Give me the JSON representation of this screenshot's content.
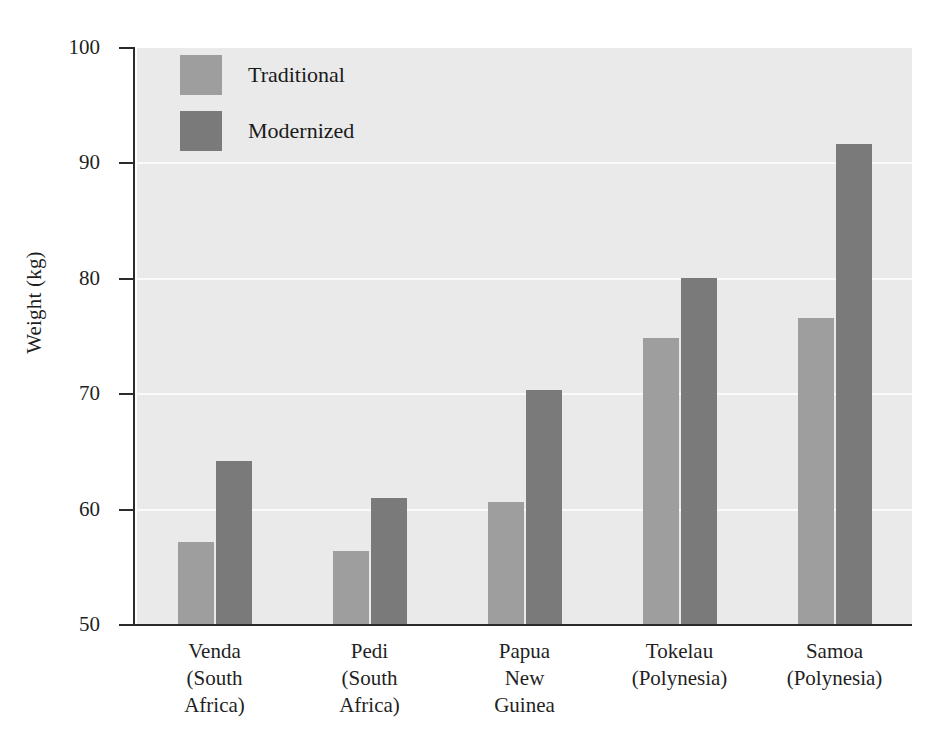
{
  "chart_data": {
    "type": "bar",
    "title": "",
    "xlabel": "",
    "ylabel": "Weight (kg)",
    "ylim": [
      50,
      100
    ],
    "yticks": [
      50,
      60,
      70,
      80,
      90,
      100
    ],
    "ytick_labels": [
      "50",
      "60",
      "70",
      "80",
      "90",
      "100"
    ],
    "grid": true,
    "grid_axis": "y",
    "legend_position": "upper left",
    "categories": [
      "Venda\n(South\nAfrica)",
      "Pedi\n(South\nAfrica)",
      "Papua\nNew\nGuinea",
      "Tokelau\n(Polynesia)",
      "Samoa\n(Polynesia)"
    ],
    "category_lines": [
      [
        "Venda",
        "(South",
        "Africa)"
      ],
      [
        "Pedi",
        "(South",
        "Africa)"
      ],
      [
        "Papua",
        "New",
        "Guinea"
      ],
      [
        "Tokelau",
        "(Polynesia)"
      ],
      [
        "Samoa",
        "(Polynesia)"
      ]
    ],
    "series": [
      {
        "name": "Traditional",
        "color": "#9e9e9e",
        "values": [
          57.2,
          56.4,
          60.7,
          74.9,
          76.6
        ]
      },
      {
        "name": "Modernized",
        "color": "#7a7a7a",
        "values": [
          64.2,
          61.0,
          70.4,
          80.1,
          91.7
        ]
      }
    ]
  },
  "legend": {
    "items": [
      {
        "label": "Traditional",
        "color": "#9e9e9e"
      },
      {
        "label": "Modernized",
        "color": "#7a7a7a"
      }
    ]
  },
  "colors": {
    "plot_background": "#eaeaea",
    "page_background": "#ffffff",
    "gridline": "#fafafa",
    "axis": "#2b2b2b",
    "text": "#1f1f1f",
    "traditional_bar": "#9e9e9e",
    "modernized_bar": "#7a7a7a"
  }
}
